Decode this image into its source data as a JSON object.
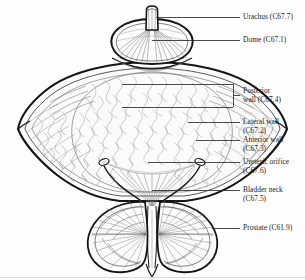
{
  "figure": {
    "view": "coronal section, anterior view",
    "colors": {
      "background": "#fefefe",
      "outline": "#1a1a1a",
      "hatch": "#6e6e6e",
      "fill": "#fbfbfb",
      "leader": "#2b2b2b",
      "text": "#1a1a1a"
    },
    "parts": [
      {
        "name": "urachus",
        "label": "Urachus (C67.7)"
      },
      {
        "name": "dome",
        "label": "Dome (C67.1)"
      },
      {
        "name": "posterior-wall",
        "label": "Posterior wall (C67.4)"
      },
      {
        "name": "lateral-wall",
        "label": "Lateral wall (C67.2)"
      },
      {
        "name": "anterior-wall",
        "label": "Anterior wall (C67.3)"
      },
      {
        "name": "ureteric-orifice",
        "label": "Ureteric orifice (C67.6)"
      },
      {
        "name": "bladder-neck",
        "label": "Bladder neck (C67.5)"
      },
      {
        "name": "prostate",
        "label": "Prostate (C61.9)"
      }
    ]
  },
  "labels": {
    "urachus": {
      "line1": "Urachus (C67.7)",
      "line2": ""
    },
    "dome": {
      "line1": "Dome (C67.1)",
      "line2": ""
    },
    "posterior_wall": {
      "line1": "Posterior",
      "line2": "wall (C67.4)"
    },
    "lateral_wall": {
      "line1": "Lateral wall",
      "line2": "(C67.2)"
    },
    "anterior_wall": {
      "line1": "Anterior wall",
      "line2": "(C67.3)"
    },
    "ureteric_orifice": {
      "line1": "Ureteric orifice",
      "line2": "(C67.6)"
    },
    "bladder_neck": {
      "line1": "Bladder neck",
      "line2": "(C67.5)"
    },
    "prostate": {
      "line1": "Prostate (C61.9)",
      "line2": ""
    }
  }
}
